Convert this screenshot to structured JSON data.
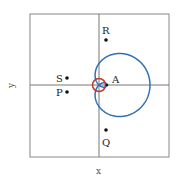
{
  "diagram": {
    "type": "polar-curve",
    "axes": {
      "x_label": "x",
      "y_label": "y"
    },
    "colors": {
      "curve": "#2f6fba",
      "circle": "#c0392b",
      "axis": "#777777",
      "frame": "#888888",
      "point": "#111111"
    },
    "points": [
      {
        "id": "R",
        "label": "R"
      },
      {
        "id": "S",
        "label": "S"
      },
      {
        "id": "P",
        "label": "P"
      },
      {
        "id": "A",
        "label": "A"
      },
      {
        "id": "Q",
        "label": "Q"
      }
    ]
  }
}
